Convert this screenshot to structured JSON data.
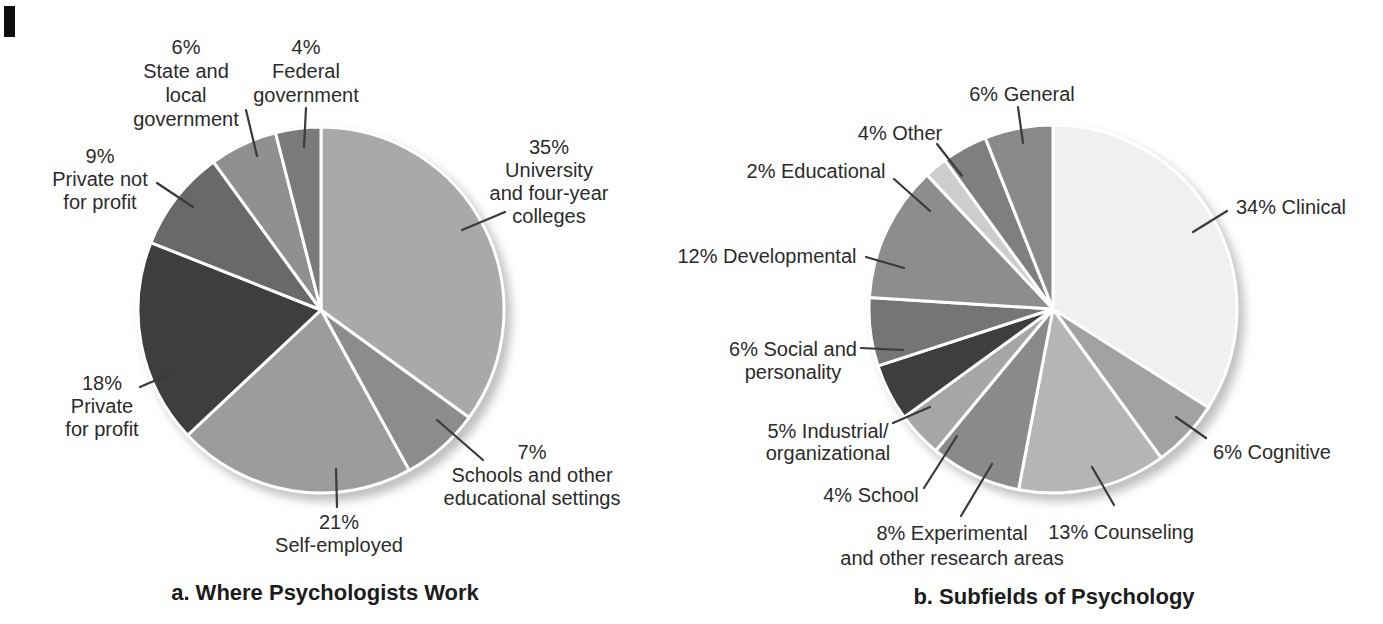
{
  "chart_data": [
    {
      "type": "pie",
      "title": "a. Where Psychologists Work",
      "start_at": "12-o'clock",
      "direction": "clockwise",
      "legend": "none (external labels with leader lines)",
      "slices": [
        {
          "label": "University and four-year colleges",
          "value_pct": 35,
          "display": "35%",
          "color": "#a9a9a9"
        },
        {
          "label": "Schools and other educational settings",
          "value_pct": 7,
          "display": "7%",
          "color": "#8c8c8c"
        },
        {
          "label": "Self-employed",
          "value_pct": 21,
          "display": "21%",
          "color": "#9c9c9c"
        },
        {
          "label": "Private for profit",
          "value_pct": 18,
          "display": "18%",
          "color": "#3e3e3e"
        },
        {
          "label": "Private not for profit",
          "value_pct": 9,
          "display": "9%",
          "color": "#696969"
        },
        {
          "label": "State and local government",
          "value_pct": 6,
          "display": "6%",
          "color": "#909090"
        },
        {
          "label": "Federal government",
          "value_pct": 4,
          "display": "4%",
          "color": "#7a7a7a"
        }
      ]
    },
    {
      "type": "pie",
      "title": "b. Subfields of Psychology",
      "start_at": "12-o'clock",
      "direction": "clockwise",
      "legend": "none (external labels with leader lines)",
      "slices": [
        {
          "label": "Clinical",
          "value_pct": 34,
          "display": "34%",
          "color": "#f0f0f0"
        },
        {
          "label": "Cognitive",
          "value_pct": 6,
          "display": "6%",
          "color": "#a2a2a2"
        },
        {
          "label": "Counseling",
          "value_pct": 13,
          "display": "13%",
          "color": "#b5b5b5"
        },
        {
          "label": "Experimental and other research areas",
          "value_pct": 8,
          "display": "8%",
          "color": "#8a8a8a"
        },
        {
          "label": "School",
          "value_pct": 4,
          "display": "4%",
          "color": "#a6a6a6"
        },
        {
          "label": "Industrial/organizational",
          "value_pct": 5,
          "display": "5%",
          "color": "#3e3e3e"
        },
        {
          "label": "Social and personality",
          "value_pct": 6,
          "display": "6%",
          "color": "#757575"
        },
        {
          "label": "Developmental",
          "value_pct": 12,
          "display": "12%",
          "color": "#8d8d8d"
        },
        {
          "label": "Educational",
          "value_pct": 2,
          "display": "2%",
          "color": "#cdcdcd"
        },
        {
          "label": "Other",
          "value_pct": 4,
          "display": "4%",
          "color": "#7f7f7f"
        },
        {
          "label": "General",
          "value_pct": 6,
          "display": "6%",
          "color": "#898989"
        }
      ]
    }
  ],
  "figure": {
    "background": "#ffffff",
    "text_color": "#2b2b2b",
    "leader_line_color": "#3a3a3a",
    "slice_gap_color": "#ffffff",
    "charts": [
      {
        "name": "pie-where-psychologists-work",
        "center": {
          "x": 321,
          "y": 310
        },
        "radius": 183,
        "labels": [
          {
            "slice": "university-and-four-year-colleges",
            "cx": 549,
            "top": 136,
            "lines": [
              "35%",
              "University",
              "and four-year",
              "colleges"
            ],
            "leader": [
              505,
              212,
              462,
              230
            ]
          },
          {
            "slice": "schools-and-other-educational-settings",
            "cx": 532,
            "top": 441,
            "lines": [
              "7%",
              "Schools and other",
              "educational settings"
            ],
            "leader": [
              437,
              420,
              483,
              460
            ]
          },
          {
            "slice": "self-employed",
            "cx": 339,
            "top": 511,
            "lines": [
              "21%",
              "Self-employed"
            ],
            "leader": [
              336,
              469,
              337,
              507
            ]
          },
          {
            "slice": "private-for-profit",
            "cx": 102,
            "top": 372,
            "lines": [
              "18%",
              "Private",
              "for profit"
            ],
            "leader": [
              140,
              387,
              170,
              374
            ]
          },
          {
            "slice": "private-not-for-profit",
            "cx": 100,
            "top": 145,
            "lines": [
              "9%",
              "Private not",
              "for profit"
            ],
            "leader": [
              157,
              183,
              193,
              207
            ]
          },
          {
            "slice": "state-and-local-government",
            "cx": 186,
            "top": 35,
            "line_height": 24,
            "lines": [
              "6%",
              "State and",
              "local",
              "government"
            ],
            "leader": [
              246,
              110,
              257,
              156
            ]
          },
          {
            "slice": "federal-government",
            "cx": 306,
            "top": 35,
            "line_height": 24,
            "lines": [
              "4%",
              "Federal",
              "government"
            ],
            "leader": [
              306,
              108,
              304,
              147
            ]
          }
        ]
      },
      {
        "name": "pie-subfields-of-psychology",
        "center": {
          "x": 1053,
          "y": 309
        },
        "radius": 184,
        "labels": [
          {
            "slice": "clinical",
            "cx": 1291,
            "top": 196,
            "lines": [
              "34% Clinical"
            ],
            "leader": [
              1193,
              232,
              1227,
              211
            ]
          },
          {
            "slice": "cognitive",
            "cx": 1272,
            "top": 441,
            "lines": [
              "6% Cognitive"
            ],
            "leader": [
              1176,
              417,
              1206,
              438
            ]
          },
          {
            "slice": "counseling",
            "cx": 1121,
            "top": 521,
            "lines": [
              "13% Counseling"
            ],
            "leader": [
              1092,
              467,
              1114,
              505
            ]
          },
          {
            "slice": "experimental-and-other-research-areas",
            "cx": 952,
            "top": 521,
            "line_height": 25,
            "lines": [
              "8% Experimental",
              "and other research areas"
            ],
            "leader": [
              992,
              464,
              961,
              516
            ]
          },
          {
            "slice": "school",
            "cx": 871,
            "top": 484,
            "lines": [
              "4% School"
            ],
            "leader": [
              924,
              488,
              957,
              436
            ]
          },
          {
            "slice": "industrial-organizational",
            "cx": 828,
            "top": 420,
            "line_height": 22,
            "lines": [
              "5% Industrial/",
              "organizational"
            ],
            "leader": [
              893,
              423,
              930,
              407
            ]
          },
          {
            "slice": "social-and-personality",
            "cx": 793,
            "top": 338,
            "lines": [
              "6% Social and",
              "personality"
            ],
            "leader": [
              861,
              348,
              903,
              350
            ]
          },
          {
            "slice": "developmental",
            "cx": 767,
            "top": 245,
            "lines": [
              "12% Developmental"
            ],
            "leader": [
              866,
              257,
              904,
              268
            ]
          },
          {
            "slice": "educational",
            "cx": 816,
            "top": 160,
            "lines": [
              "2% Educational"
            ],
            "leader": [
              894,
              179,
              930,
              211
            ]
          },
          {
            "slice": "other",
            "cx": 900,
            "top": 122,
            "lines": [
              "4% Other"
            ],
            "leader": [
              937,
              144,
              962,
              176
            ]
          },
          {
            "slice": "general",
            "cx": 1022,
            "top": 83,
            "lines": [
              "6% General"
            ],
            "leader": [
              1018,
              107,
              1023,
              143
            ]
          }
        ]
      }
    ]
  }
}
